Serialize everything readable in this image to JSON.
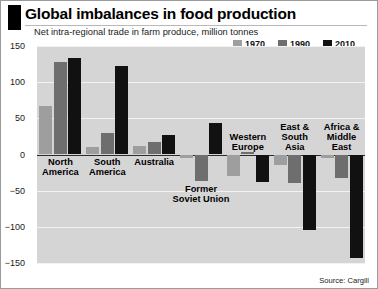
{
  "header": {
    "title": "Global imbalances in food production",
    "subtitle": "Net intra-regional trade in farm produce, million tonnes"
  },
  "source": "Source: Cargill",
  "colors": {
    "series_1970": "#9e9e9e",
    "series_1990": "#6e6e6e",
    "series_2010": "#111111",
    "plot_background": "#d5d5d5",
    "gridline": "#f2f2f2",
    "zeroline": "#2b2b2b",
    "header_bar": "#000000"
  },
  "chart_data": {
    "type": "bar",
    "title": "Global imbalances in food production",
    "subtitle": "Net intra-regional trade in farm produce, million tonnes",
    "xlabel": "",
    "ylabel": "million tonnes",
    "ylim": [
      -150,
      150
    ],
    "yticks": [
      150,
      100,
      50,
      0,
      -50,
      -100,
      -150
    ],
    "ytick_labels": [
      "150",
      "100",
      "50",
      "0",
      "−50",
      "−100",
      "−150"
    ],
    "grid": true,
    "legend_position": "top-right",
    "categories": [
      "North America",
      "South America",
      "Australia",
      "Former Soviet Union",
      "Western Europe",
      "East & South Asia",
      "Africa & Middle East"
    ],
    "category_lines": [
      [
        "North",
        "America"
      ],
      [
        "South",
        "America"
      ],
      [
        "Australia"
      ],
      [
        "Former",
        "Soviet Union"
      ],
      [
        "Western",
        "Europe"
      ],
      [
        "East &",
        "South",
        "Asia"
      ],
      [
        "Africa &",
        "Middle",
        "East"
      ]
    ],
    "series": [
      {
        "name": "1970",
        "color": "#9e9e9e",
        "values": [
          67,
          10,
          12,
          -5,
          -30,
          -15,
          -5
        ]
      },
      {
        "name": "1990",
        "color": "#6e6e6e",
        "values": [
          128,
          30,
          17,
          -37,
          3,
          -40,
          -33
        ]
      },
      {
        "name": "2010",
        "color": "#111111",
        "values": [
          133,
          122,
          27,
          43,
          -38,
          -105,
          -143
        ]
      }
    ]
  }
}
